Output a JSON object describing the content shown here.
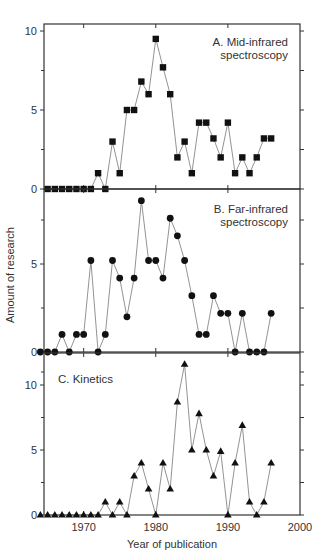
{
  "figure": {
    "ylabel": "Amount of research",
    "xlabel": "Year of publication",
    "x_ticks": [
      1970,
      1980,
      1990,
      2000
    ]
  },
  "chart_data": [
    {
      "type": "line",
      "title": "A. Mid-infrared spectroscopy",
      "title_lines": [
        "A. Mid-infrared",
        "spectroscopy"
      ],
      "marker": "square",
      "xlabel": "Year of publication",
      "ylabel": "Amount of research",
      "xlim": [
        1964.5,
        2000
      ],
      "ylim": [
        0,
        10
      ],
      "y_ticks": [
        0,
        5,
        10
      ],
      "x": [
        1965,
        1966,
        1967,
        1968,
        1969,
        1970,
        1971,
        1972,
        1973,
        1974,
        1975,
        1976,
        1977,
        1978,
        1979,
        1980,
        1981,
        1982,
        1983,
        1984,
        1985,
        1986,
        1987,
        1988,
        1989,
        1990,
        1991,
        1992,
        1993,
        1994,
        1995,
        1996
      ],
      "values": [
        0,
        0,
        0,
        0,
        0,
        0,
        0,
        1,
        0,
        3,
        1,
        5,
        5,
        6.8,
        6,
        9.5,
        7.7,
        6,
        2,
        3,
        1,
        4.2,
        4.2,
        3.2,
        2,
        4.2,
        1,
        2,
        1,
        2,
        3.2,
        3.2
      ]
    },
    {
      "type": "line",
      "title": "B. Far-infrared spectroscopy",
      "title_lines": [
        "B. Far-infrared",
        "spectroscopy"
      ],
      "marker": "circle",
      "xlabel": "Year of publication",
      "ylabel": "Amount of research",
      "xlim": [
        1964.5,
        2000
      ],
      "ylim": [
        0,
        9
      ],
      "y_ticks": [
        0,
        5
      ],
      "x": [
        1964,
        1965,
        1966,
        1967,
        1968,
        1969,
        1970,
        1971,
        1972,
        1973,
        1974,
        1975,
        1976,
        1977,
        1978,
        1979,
        1980,
        1981,
        1982,
        1983,
        1984,
        1985,
        1986,
        1987,
        1988,
        1989,
        1990,
        1991,
        1992,
        1993,
        1994,
        1995,
        1996
      ],
      "values": [
        0,
        0,
        0,
        1,
        0,
        1,
        1,
        5.2,
        0,
        1,
        5.2,
        4.2,
        2,
        4.2,
        8.6,
        5.2,
        5.2,
        4.2,
        7.6,
        6.6,
        5.2,
        3.2,
        1,
        1,
        3.2,
        2.2,
        2.2,
        0,
        2.2,
        0,
        0,
        0,
        2.2
      ]
    },
    {
      "type": "line",
      "title": "C. Kinetics",
      "title_lines": [
        "C. Kinetics"
      ],
      "marker": "triangle",
      "xlabel": "Year of publication",
      "ylabel": "Amount of research",
      "xlim": [
        1964.5,
        2000
      ],
      "ylim": [
        0,
        12
      ],
      "y_ticks": [
        0,
        5,
        10
      ],
      "x": [
        1964,
        1965,
        1966,
        1967,
        1968,
        1969,
        1970,
        1971,
        1972,
        1973,
        1974,
        1975,
        1976,
        1977,
        1978,
        1979,
        1980,
        1981,
        1982,
        1983,
        1984,
        1985,
        1986,
        1987,
        1988,
        1989,
        1990,
        1991,
        1992,
        1993,
        1994,
        1995,
        1996
      ],
      "values": [
        0,
        0,
        0,
        0,
        0,
        0,
        0,
        0,
        0,
        1,
        0,
        1,
        0,
        3,
        4,
        2,
        0,
        4,
        2,
        8.7,
        11.6,
        5,
        7.8,
        5,
        3,
        4.9,
        0,
        4,
        6.9,
        1,
        0,
        1,
        4
      ]
    }
  ]
}
